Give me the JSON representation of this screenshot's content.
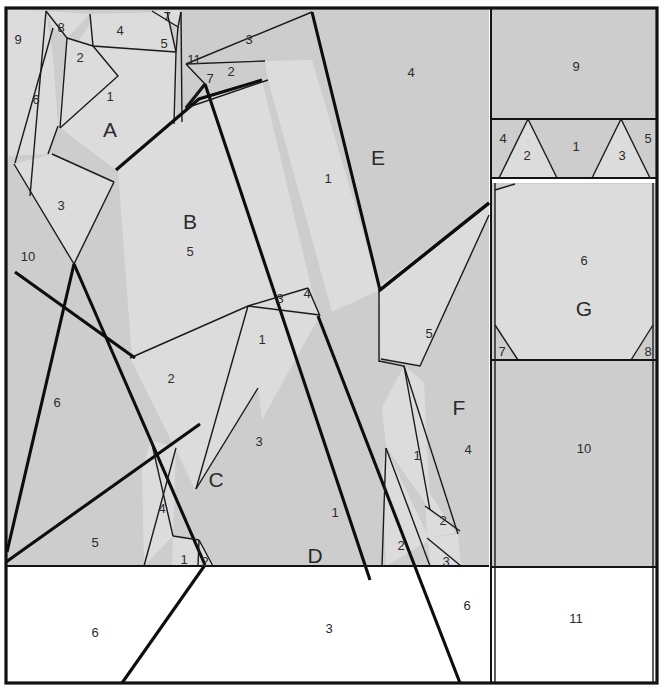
{
  "figure": {
    "kind": "geometric-partition-diagram",
    "width": 664,
    "height": 695,
    "colors": {
      "fill_gray": "#cdcdcd",
      "fill_gray_light": "#dcdcdc",
      "fill_white": "#ffffff",
      "stroke": "#111111",
      "label_text": "#2b2b2b"
    }
  },
  "labels": {
    "big": [
      {
        "id": "region-a",
        "text": "A",
        "x": 110,
        "y": 131
      },
      {
        "id": "region-b",
        "text": "B",
        "x": 190,
        "y": 223
      },
      {
        "id": "region-c",
        "text": "C",
        "x": 216,
        "y": 481
      },
      {
        "id": "region-d",
        "text": "D",
        "x": 315,
        "y": 557
      },
      {
        "id": "region-e",
        "text": "E",
        "x": 378,
        "y": 159
      },
      {
        "id": "region-f",
        "text": "F",
        "x": 459,
        "y": 409
      },
      {
        "id": "region-g",
        "text": "G",
        "x": 584,
        "y": 310
      }
    ],
    "numbers": [
      {
        "id": "n-9-topleft",
        "text": "9",
        "x": 18,
        "y": 41
      },
      {
        "id": "n-8-topleft",
        "text": "8",
        "x": 61,
        "y": 29
      },
      {
        "id": "n-4-top",
        "text": "4",
        "x": 120,
        "y": 32
      },
      {
        "id": "n-7-top",
        "text": "7",
        "x": 167,
        "y": 18
      },
      {
        "id": "n-5-top",
        "text": "5",
        "x": 164,
        "y": 45
      },
      {
        "id": "n-2-topleft",
        "text": "2",
        "x": 80,
        "y": 59
      },
      {
        "id": "n-6-left",
        "text": "6",
        "x": 36,
        "y": 101
      },
      {
        "id": "n-1-a",
        "text": "1",
        "x": 110,
        "y": 98
      },
      {
        "id": "n-11",
        "text": "11",
        "x": 194,
        "y": 61
      },
      {
        "id": "n-7-mid",
        "text": "7",
        "x": 210,
        "y": 80
      },
      {
        "id": "n-2-mid",
        "text": "2",
        "x": 231,
        "y": 73
      },
      {
        "id": "n-3-topmid",
        "text": "3",
        "x": 249,
        "y": 41
      },
      {
        "id": "n-4-e",
        "text": "4",
        "x": 411,
        "y": 74
      },
      {
        "id": "n-1-e",
        "text": "1",
        "x": 328,
        "y": 180
      },
      {
        "id": "n-3-left",
        "text": "3",
        "x": 61,
        "y": 207
      },
      {
        "id": "n-10-left",
        "text": "10",
        "x": 28,
        "y": 258
      },
      {
        "id": "n-5-b",
        "text": "5",
        "x": 190,
        "y": 253
      },
      {
        "id": "n-3-small",
        "text": "3",
        "x": 280,
        "y": 300
      },
      {
        "id": "n-4-small",
        "text": "4",
        "x": 307,
        "y": 295
      },
      {
        "id": "n-1-mid",
        "text": "1",
        "x": 262,
        "y": 341
      },
      {
        "id": "n-2-mid2",
        "text": "2",
        "x": 171,
        "y": 380
      },
      {
        "id": "n-6-bigleft",
        "text": "6",
        "x": 57,
        "y": 404
      },
      {
        "id": "n-5-lower",
        "text": "5",
        "x": 429,
        "y": 335
      },
      {
        "id": "n-3-c",
        "text": "3",
        "x": 259,
        "y": 443
      },
      {
        "id": "n-1-f",
        "text": "1",
        "x": 417,
        "y": 457
      },
      {
        "id": "n-4-f",
        "text": "4",
        "x": 468,
        "y": 451
      },
      {
        "id": "n-4-c",
        "text": "4",
        "x": 162,
        "y": 510
      },
      {
        "id": "n-1-d",
        "text": "1",
        "x": 335,
        "y": 514
      },
      {
        "id": "n-5-bottomleft",
        "text": "5",
        "x": 95,
        "y": 544
      },
      {
        "id": "n-1-tiny",
        "text": "1",
        "x": 184,
        "y": 561
      },
      {
        "id": "n-2-tiny",
        "text": "2",
        "x": 205,
        "y": 563
      },
      {
        "id": "n-2-fbot",
        "text": "2",
        "x": 443,
        "y": 522
      },
      {
        "id": "n-2-fbot2",
        "text": "2",
        "x": 401,
        "y": 547
      },
      {
        "id": "n-3-fbot",
        "text": "3",
        "x": 446,
        "y": 563
      },
      {
        "id": "n-9-right",
        "text": "9",
        "x": 576,
        "y": 68
      },
      {
        "id": "n-4-right",
        "text": "4",
        "x": 503,
        "y": 140
      },
      {
        "id": "n-2-right",
        "text": "2",
        "x": 527,
        "y": 157
      },
      {
        "id": "n-1-right",
        "text": "1",
        "x": 576,
        "y": 148
      },
      {
        "id": "n-3-right",
        "text": "3",
        "x": 622,
        "y": 157
      },
      {
        "id": "n-5-right",
        "text": "5",
        "x": 648,
        "y": 140
      },
      {
        "id": "n-6-g",
        "text": "6",
        "x": 584,
        "y": 262
      },
      {
        "id": "n-7-g",
        "text": "7",
        "x": 502,
        "y": 353
      },
      {
        "id": "n-8-g",
        "text": "8",
        "x": 648,
        "y": 353
      },
      {
        "id": "n-10-right",
        "text": "10",
        "x": 584,
        "y": 450
      },
      {
        "id": "n-11-right",
        "text": "11",
        "x": 576,
        "y": 620
      },
      {
        "id": "n-6-bottom",
        "text": "6",
        "x": 95,
        "y": 634
      },
      {
        "id": "n-3-bottom",
        "text": "3",
        "x": 329,
        "y": 630
      },
      {
        "id": "n-6-bottomr",
        "text": "6",
        "x": 467,
        "y": 607
      }
    ]
  },
  "regions": {
    "left_panel": {
      "gray_fill_bounds": {
        "x1": 6,
        "y1": 8,
        "x2": 489,
        "y2": 567
      },
      "white_fill_bounds": {
        "x1": 6,
        "y1": 567,
        "x2": 489,
        "y2": 683
      }
    },
    "right_panel": {
      "x1": 492,
      "x2": 657,
      "bands": [
        {
          "name": "band-9",
          "y1": 8,
          "y2": 119
        },
        {
          "name": "band-triangles",
          "y1": 119,
          "y2": 178
        },
        {
          "name": "band-g",
          "y1": 183,
          "y2": 360
        },
        {
          "name": "band-10",
          "y1": 360,
          "y2": 567
        },
        {
          "name": "band-11",
          "y1": 567,
          "y2": 683
        }
      ]
    }
  },
  "chart_data": {
    "type": "table",
    "title": "",
    "note": "polygon partition; labels are region identifiers"
  }
}
